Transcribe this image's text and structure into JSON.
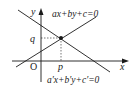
{
  "diagram": {
    "axes": {
      "x_label": "x",
      "y_label": "y",
      "origin_label": "O"
    },
    "intersection": {
      "x_label": "p",
      "y_label": "q"
    },
    "lines": [
      {
        "name": "line-1",
        "equation": "ax+by+c=0",
        "slope": "positive"
      },
      {
        "name": "line-2",
        "equation": "a′x+b′y+c′=0",
        "slope": "negative"
      }
    ],
    "colors": {
      "stroke": "#1a1a1a",
      "background": "#ffffff"
    }
  }
}
